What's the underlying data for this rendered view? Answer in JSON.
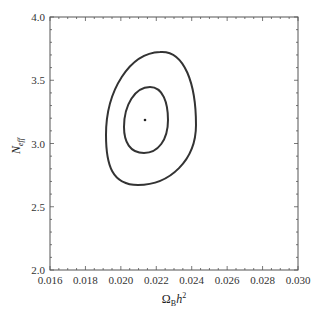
{
  "chart_data": {
    "type": "contour",
    "title": "",
    "xlabel": "Ω_B h²",
    "ylabel": "N_eff",
    "xlim": [
      0.016,
      0.03
    ],
    "ylim": [
      2.0,
      4.0
    ],
    "x_ticks": [
      "0.016",
      "0.018",
      "0.020",
      "0.022",
      "0.024",
      "0.026",
      "0.028",
      "0.030"
    ],
    "y_ticks": [
      "2.0",
      "2.5",
      "3.0",
      "3.5",
      "4.0"
    ],
    "grid": false,
    "legend": null,
    "best_fit_point": {
      "x": 0.0214,
      "y": 3.19
    },
    "contours": [
      {
        "name": "inner (1σ)",
        "x_range": [
          0.0202,
          0.0226
        ],
        "y_range": [
          2.92,
          3.46
        ]
      },
      {
        "name": "outer (2σ)",
        "x_range": [
          0.0191,
          0.0241
        ],
        "y_range": [
          2.67,
          3.74
        ]
      }
    ]
  },
  "labels": {
    "x_main": "Ω",
    "x_sub": "B",
    "x_h": "h",
    "x_sup": "2",
    "y_main": "N",
    "y_sub": "eff"
  }
}
